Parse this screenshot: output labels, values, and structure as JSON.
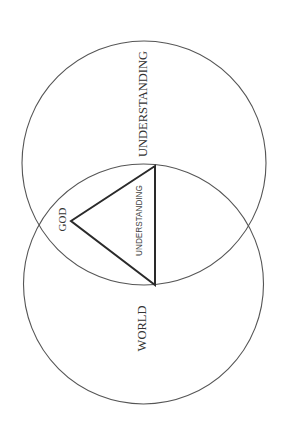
{
  "diagram": {
    "type": "venn-with-triangle",
    "orientation": "rotated -90deg (text reads bottom-to-top)",
    "circles": [
      {
        "id": "understanding-circle",
        "label": "UNDERSTANDING"
      },
      {
        "id": "world-circle",
        "label": "WORLD"
      }
    ],
    "intersection": {
      "triangle_label": "UNDERSTANDING",
      "vertex_label": "GOD"
    },
    "colors": {
      "background": "#ffffff",
      "circle_stroke": "#555555",
      "triangle_stroke": "#2a2a2a",
      "text": "#333333"
    }
  }
}
